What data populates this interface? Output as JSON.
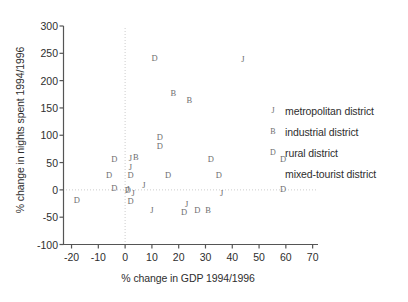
{
  "chart_data": {
    "type": "scatter",
    "title": "",
    "xlabel": "% change in GDP 1994/1996",
    "ylabel": "% change in nights spent 1994/1996",
    "xlim": [
      -23,
      72
    ],
    "ylim": [
      -100,
      300
    ],
    "xticks": [
      -20,
      -10,
      0,
      10,
      20,
      30,
      40,
      50,
      60,
      70
    ],
    "yticks": [
      -100,
      -50,
      0,
      50,
      100,
      150,
      200,
      250,
      300
    ],
    "xtick_labels": [
      "-20",
      "-10",
      "0",
      "10",
      "20",
      "30",
      "40",
      "50",
      "60",
      "70"
    ],
    "ytick_labels": [
      "-100",
      "-50",
      "0",
      "50",
      "100",
      "150",
      "200",
      "250",
      "300"
    ],
    "grid": false,
    "reference_lines": [
      {
        "axis": "x",
        "value": 0
      },
      {
        "axis": "y",
        "value": 0
      }
    ],
    "marker_style": "letter-coded",
    "legend_position": "right",
    "series": [
      {
        "name": "metropolitan district",
        "marker": "J",
        "points": [
          {
            "x": 44,
            "y": 238
          },
          {
            "x": 2,
            "y": 56
          },
          {
            "x": 2,
            "y": 40
          },
          {
            "x": 7,
            "y": 8
          },
          {
            "x": 3,
            "y": -8
          },
          {
            "x": 36,
            "y": -8
          },
          {
            "x": 10,
            "y": -38
          },
          {
            "x": 23,
            "y": -28
          },
          {
            "x": 1,
            "y": 0
          }
        ]
      },
      {
        "name": "industrial district",
        "marker": "B",
        "points": [
          {
            "x": 18,
            "y": 175
          },
          {
            "x": 24,
            "y": 163
          },
          {
            "x": 4,
            "y": 58
          },
          {
            "x": 31,
            "y": -38
          }
        ]
      },
      {
        "name": "rural district",
        "marker": "D",
        "points": [
          {
            "x": 11,
            "y": 240
          },
          {
            "x": 13,
            "y": 95
          },
          {
            "x": 13,
            "y": 78
          },
          {
            "x": -4,
            "y": 55
          },
          {
            "x": 32,
            "y": 55
          },
          {
            "x": 59,
            "y": 55
          },
          {
            "x": -6,
            "y": 25
          },
          {
            "x": 2,
            "y": 25
          },
          {
            "x": 16,
            "y": 25
          },
          {
            "x": 35,
            "y": 25
          },
          {
            "x": -4,
            "y": 2
          },
          {
            "x": 1,
            "y": -2
          },
          {
            "x": 59,
            "y": 0
          },
          {
            "x": 2,
            "y": -22
          },
          {
            "x": -18,
            "y": -20
          },
          {
            "x": 22,
            "y": -42
          },
          {
            "x": 27,
            "y": -38
          }
        ]
      },
      {
        "name": "mixed-tourist district",
        "marker": "",
        "points": []
      }
    ],
    "legend_entries": [
      {
        "marker": "J",
        "label": "metropolitan district"
      },
      {
        "marker": "B",
        "label": "industrial district"
      },
      {
        "marker": "D",
        "label": "rural district"
      },
      {
        "marker": "",
        "label": "mixed-tourist district"
      }
    ],
    "colors": {
      "axis": "#555555",
      "point": "#6e6e6e",
      "reference_line": "#c8c8c8",
      "text": "#2e2e2e",
      "background": "#ffffff"
    }
  }
}
